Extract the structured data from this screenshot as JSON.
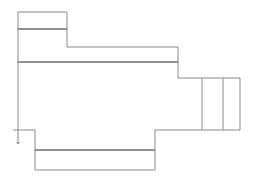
{
  "diagram": {
    "title": "",
    "colors": {
      "outline": "#8a8a8a",
      "divider": "#6e6e6e",
      "background": "#ffffff"
    },
    "outline_path": "M18,12 L67,12 L67,47 L178,47 L178,78 L240,78 L240,130 L155,130 L155,170 L35,170 L35,130 L18,130 Z",
    "dividers": [
      {
        "name": "top-box-divider",
        "x1": 18,
        "y1": 29,
        "x2": 67,
        "y2": 29
      },
      {
        "name": "main-divider",
        "x1": 18,
        "y1": 62,
        "x2": 178,
        "y2": 62
      },
      {
        "name": "bottom-box-divider",
        "x1": 35,
        "y1": 150,
        "x2": 155,
        "y2": 150
      },
      {
        "name": "right-box-divider-1",
        "x1": 202,
        "y1": 78,
        "x2": 202,
        "y2": 130
      },
      {
        "name": "right-box-divider-2",
        "x1": 223,
        "y1": 78,
        "x2": 223,
        "y2": 130
      }
    ],
    "marker": {
      "x": 18,
      "y": 130,
      "tick_x": 13,
      "arrow_end_y": 144
    }
  }
}
